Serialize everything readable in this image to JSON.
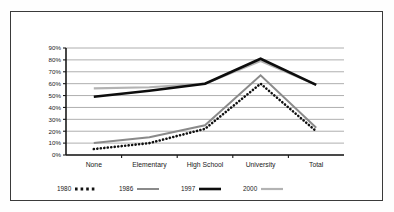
{
  "chart_data": {
    "type": "line",
    "title": "",
    "subtitle": "",
    "xlabel": "",
    "ylabel": "",
    "categories": [
      "None",
      "Elementary",
      "High School",
      "University",
      "Total"
    ],
    "ylim": [
      0,
      90
    ],
    "y_ticks": [
      "0%",
      "10%",
      "20%",
      "30%",
      "40%",
      "50%",
      "60%",
      "70%",
      "80%",
      "90%"
    ],
    "y_tick_values": [
      0,
      10,
      20,
      30,
      40,
      50,
      60,
      70,
      80,
      90
    ],
    "grid": true,
    "legend_position": "bottom",
    "series": [
      {
        "name": "1980",
        "values": [
          5,
          10,
          22,
          60,
          20
        ],
        "color": "#111111",
        "style": "dotted",
        "width": 2.6
      },
      {
        "name": "1986",
        "values": [
          10,
          15,
          25,
          67,
          23
        ],
        "color": "#8a8a8a",
        "style": "solid",
        "width": 2.0
      },
      {
        "name": "1997",
        "values": [
          49,
          54,
          60,
          81,
          59
        ],
        "color": "#0d0d0d",
        "style": "solid",
        "width": 2.6
      },
      {
        "name": "2000",
        "values": [
          56,
          57,
          60,
          79,
          59
        ],
        "color": "#b3b3b3",
        "style": "solid",
        "width": 2.2
      }
    ]
  },
  "legend": {
    "items": [
      {
        "label": "1980",
        "marker": "dotted-swatch"
      },
      {
        "label": "1986",
        "marker": "line-swatch"
      },
      {
        "label": "1997",
        "marker": "line-swatch"
      },
      {
        "label": "2000",
        "marker": "line-swatch"
      }
    ]
  },
  "axes": {
    "gridline_color": "#9a9a9a",
    "axis_color": "#1a1a1a"
  },
  "frame": {
    "border_color": "#3a3a3a",
    "background_color": "#ffffff"
  }
}
